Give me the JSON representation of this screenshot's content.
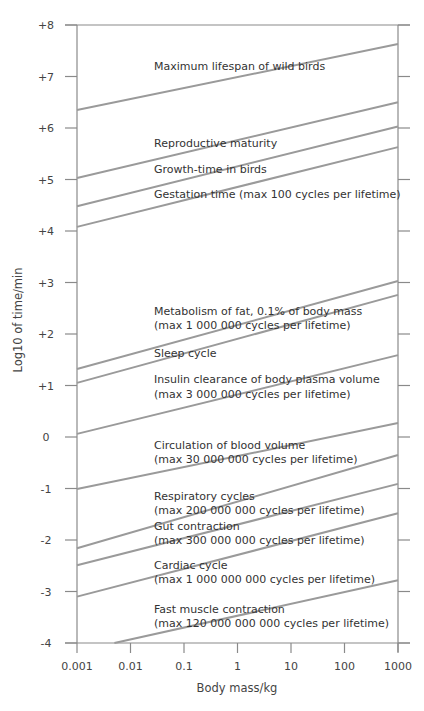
{
  "chart_data": {
    "type": "line",
    "title": "",
    "xlabel": "Body mass/kg",
    "ylabel": "Log10 of time/min",
    "xscale": "log",
    "xlim": [
      0.001,
      1000
    ],
    "ylim": [
      -4,
      8
    ],
    "grid": false,
    "legend_position": "inline-labels",
    "x_ticks": [
      "0.001",
      "0.01",
      "0.1",
      "1",
      "10",
      "100",
      "1000"
    ],
    "y_ticks": [
      "+8",
      "+7",
      "+6",
      "+5",
      "+4",
      "+3",
      "+2",
      "+1",
      "0",
      "-1",
      "-2",
      "-3",
      "-4"
    ],
    "series": [
      {
        "name": "Maximum lifespan of wild birds",
        "label_lines": [
          "Maximum lifespan of wild birds"
        ],
        "x": [
          0.001,
          1000
        ],
        "y": [
          6.35,
          7.63
        ]
      },
      {
        "name": "Reproductive maturity",
        "label_lines": [
          "Reproductive maturity"
        ],
        "x": [
          0.001,
          1000
        ],
        "y": [
          5.03,
          6.5
        ]
      },
      {
        "name": "Growth-time in birds",
        "label_lines": [
          "Growth-time in birds"
        ],
        "x": [
          0.001,
          1000
        ],
        "y": [
          4.48,
          6.03
        ]
      },
      {
        "name": "Gestation time (max 100 cycles per lifetime)",
        "label_lines": [
          "Gestation time (max 100 cycles per lifetime)"
        ],
        "x": [
          0.001,
          1000
        ],
        "y": [
          4.08,
          5.63
        ]
      },
      {
        "name": "Metabolism of fat, 0.1% of body mass (max 1 000 000 cycles per lifetime)",
        "label_lines": [
          "Metabolism of fat, 0.1% of body mass",
          "(max 1 000 000 cycles per lifetime)"
        ],
        "x": [
          0.001,
          1000
        ],
        "y": [
          1.32,
          3.03
        ]
      },
      {
        "name": "Sleep cycle",
        "label_lines": [
          "Sleep cycle"
        ],
        "x": [
          0.001,
          1000
        ],
        "y": [
          1.05,
          2.76
        ]
      },
      {
        "name": "Insulin clearance of body plasma volume (max 3 000 000 cycles per lifetime)",
        "label_lines": [
          "Insulin clearance of body plasma volume",
          "(max 3 000 000 cycles per lifetime)"
        ],
        "x": [
          0.001,
          1000
        ],
        "y": [
          0.06,
          1.59
        ]
      },
      {
        "name": "Circulation of blood volume (max 30 000 000 cycles per lifetime)",
        "label_lines": [
          "Circulation of blood volume",
          "(max 30 000 000 cycles per lifetime)"
        ],
        "x": [
          0.001,
          1000
        ],
        "y": [
          -1.01,
          0.27
        ]
      },
      {
        "name": "Respiratory cycles (max 200 000 000 cycles per lifetime)",
        "label_lines": [
          "Respiratory cycles",
          "(max 200 000 000 cycles per lifetime)"
        ],
        "x": [
          0.001,
          1000
        ],
        "y": [
          -2.16,
          -0.35
        ]
      },
      {
        "name": "Gut contraction (max 300 000 000 cycles per lifetime)",
        "label_lines": [
          "Gut contraction",
          "(max 300 000 000 cycles per lifetime)"
        ],
        "x": [
          0.001,
          1000
        ],
        "y": [
          -2.49,
          -0.91
        ]
      },
      {
        "name": "Cardiac cycle (max 1 000 000 000 cycles per lifetime)",
        "label_lines": [
          "Cardiac cycle",
          "(max 1 000 000 000 cycles per lifetime)"
        ],
        "x": [
          0.001,
          1000
        ],
        "y": [
          -3.1,
          -1.48
        ]
      },
      {
        "name": "Fast muscle contraction (max 120 000 000 000 cycles per lifetime)",
        "label_lines": [
          "Fast muscle contraction",
          "(max 120 000 000 000 cycles per lifetime)"
        ],
        "x": [
          0.005,
          1000
        ],
        "y": [
          -4.0,
          -2.78
        ]
      }
    ]
  },
  "labels": {
    "lifespan": "Maximum lifespan of wild birds",
    "repro": "Reproductive maturity",
    "growth": "Growth-time in birds",
    "gestation": "Gestation time (max 100 cycles per lifetime)",
    "metab1": "Metabolism of fat, 0.1% of body mass",
    "metab2": "(max 1 000 000 cycles per lifetime)",
    "sleep": "Sleep cycle",
    "insulin1": "Insulin clearance of body plasma volume",
    "insulin2": "(max 3 000 000 cycles per lifetime)",
    "circ1": "Circulation of blood volume",
    "circ2": "(max 30 000 000 cycles per lifetime)",
    "resp1": "Respiratory cycles",
    "resp2": "(max 200 000 000 cycles per lifetime)",
    "gut1": "Gut contraction",
    "gut2": "(max 300 000 000 cycles per lifetime)",
    "card1": "Cardiac cycle",
    "card2": "(max 1 000 000 000 cycles per lifetime)",
    "muscle1": "Fast muscle contraction",
    "muscle2": "(max 120 000 000 000 cycles per lifetime)"
  },
  "colors": {
    "line": "#9a9a9a",
    "axis": "#8a8a8a",
    "text": "#333333"
  }
}
